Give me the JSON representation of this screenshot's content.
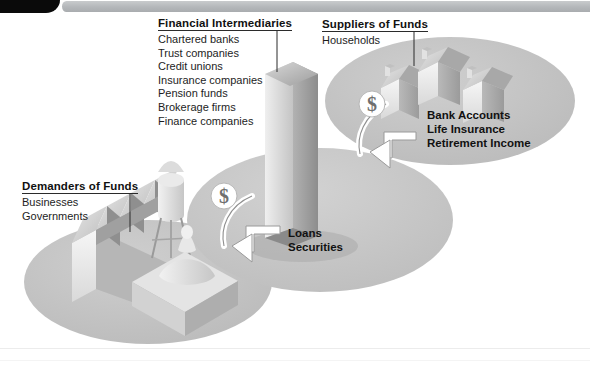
{
  "figure": {
    "type": "diagram",
    "background_color": "#ffffff",
    "ellipse_color": "#c3c3c3",
    "accent_dark": "#1a1a1a"
  },
  "header": {
    "tab_shape": "black-rounded-tab",
    "bar_shape": "gray-gradient-bar"
  },
  "groups": {
    "intermediaries": {
      "title": "Financial Intermediaries",
      "items": [
        "Chartered banks",
        "Trust companies",
        "Credit unions",
        "Insurance companies",
        "Pension funds",
        "Brokerage firms",
        "Finance companies"
      ]
    },
    "suppliers": {
      "title": "Suppliers of Funds",
      "items": [
        "Households"
      ]
    },
    "demanders": {
      "title": "Demanders of Funds",
      "items": [
        "Businesses",
        "Governments"
      ]
    }
  },
  "flow_labels": {
    "loans_securities": [
      "Loans",
      "Securities"
    ],
    "household_claims": [
      "Bank Accounts",
      "Life Insurance",
      "Retirement Income"
    ]
  },
  "icons": {
    "money_left": "$",
    "money_right": "$"
  }
}
